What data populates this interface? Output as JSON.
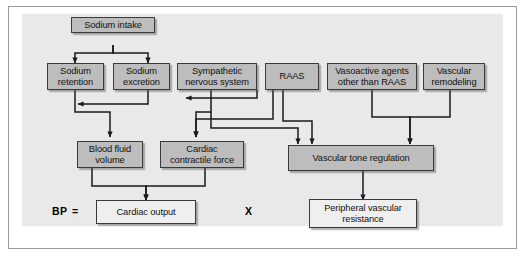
{
  "figure": {
    "background_color": "#ffffff",
    "panel_color": "#e9e9e9",
    "frame_border_color": "#9a9a9a",
    "shaded_node_color": "#bdbdbd",
    "light_node_color": "#efefef",
    "node_border_color": "#3a3a3a",
    "connector_color": "#1a1a1a"
  },
  "nodes": {
    "sodium_intake": {
      "label": "Sodium intake",
      "style": "shaded"
    },
    "sodium_retention": {
      "label": "Sodium\nretention",
      "line1": "Sodium",
      "line2": "retention",
      "style": "shaded"
    },
    "sodium_excretion": {
      "label": "Sodium\nexcretion",
      "line1": "Sodium",
      "line2": "excretion",
      "style": "shaded"
    },
    "sympathetic_nervous_system": {
      "label": "Sympathetic\nnervous system",
      "line1": "Sympathetic",
      "line2": "nervous system",
      "style": "shaded"
    },
    "raas": {
      "label": "RAAS",
      "style": "shaded"
    },
    "vasoactive_agents": {
      "label": "Vasoactive agents\nother than RAAS",
      "line1": "Vasoactive agents",
      "line2": "other than RAAS",
      "style": "shaded"
    },
    "vascular_remodeling": {
      "label": "Vascular\nremodeling",
      "line1": "Vascular",
      "line2": "remodeling",
      "style": "shaded"
    },
    "blood_fluid_volume": {
      "label": "Blood fluid\nvolume",
      "line1": "Blood fluid",
      "line2": "volume",
      "style": "shaded"
    },
    "cardiac_contractile_force": {
      "label": "Cardiac\ncontractile force",
      "line1": "Cardiac",
      "line2": "contractile force",
      "style": "shaded"
    },
    "vascular_tone_regulation": {
      "label": "Vascular tone regulation",
      "style": "shaded"
    },
    "cardiac_output": {
      "label": "Cardiac output",
      "style": "light"
    },
    "peripheral_vascular_resistance": {
      "label": "Peripheral vascular\nresistance",
      "line1": "Peripheral vascular",
      "line2": "resistance",
      "style": "light"
    }
  },
  "equation": {
    "bp_label": "BP",
    "equals_sign": "=",
    "multiply_sign": "X"
  },
  "edges": [
    {
      "from": "sodium_intake",
      "to": "sodium_retention"
    },
    {
      "from": "sodium_intake",
      "to": "sodium_excretion"
    },
    {
      "from": "sodium_excretion",
      "to": "sodium_retention"
    },
    {
      "from": "sodium_retention",
      "to": "blood_fluid_volume"
    },
    {
      "from": "sympathetic_nervous_system",
      "to": "cardiac_contractile_force"
    },
    {
      "from": "raas",
      "to": "sympathetic_nervous_system"
    },
    {
      "from": "raas",
      "to": "cardiac_contractile_force"
    },
    {
      "from": "raas",
      "to": "vascular_tone_regulation"
    },
    {
      "from": "sympathetic_nervous_system",
      "to": "vascular_tone_regulation"
    },
    {
      "from": "vasoactive_agents",
      "to": "vascular_tone_regulation"
    },
    {
      "from": "vascular_remodeling",
      "to": "vascular_tone_regulation"
    },
    {
      "from": "blood_fluid_volume",
      "to": "cardiac_output"
    },
    {
      "from": "cardiac_contractile_force",
      "to": "cardiac_output"
    },
    {
      "from": "vascular_tone_regulation",
      "to": "peripheral_vascular_resistance"
    }
  ]
}
